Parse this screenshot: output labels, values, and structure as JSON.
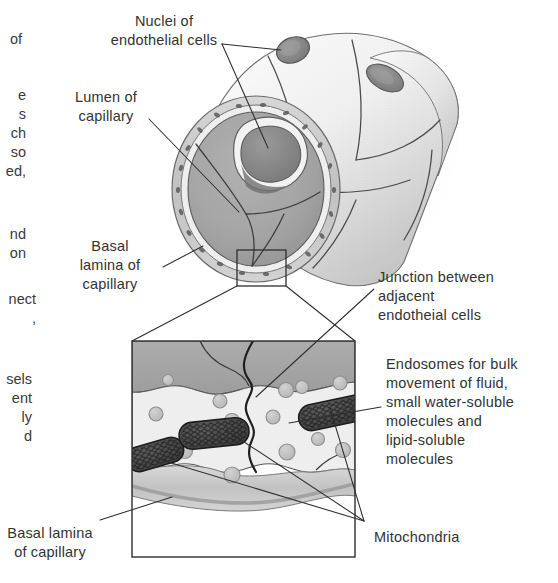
{
  "figure": {
    "colors": {
      "ink": "#333333",
      "leader_line": "#2e2e2e",
      "lumen_fill": "#a9a9a9",
      "lumen_fill_dark": "#8f8f8f",
      "tube_light": "#f4f4f4",
      "tube_mid": "#d9d9d9",
      "tube_shadow": "#b6b6b6",
      "nucleus": "#8a8a8a",
      "basal_lamina": "#c9c9c9",
      "endothelial_cytoplasm": "#ececec",
      "vesicle_fill": "#c4c4c4",
      "vesicle_stroke": "#8e8e8e",
      "mitochondrion": "#4a4a4a",
      "box_stroke": "#2e2e2e"
    }
  },
  "labels": {
    "nuclei": "Nuclei of\nendothelial cells",
    "lumen": "Lumen of\ncapillary",
    "basal_lamina_top": "Basal\nlamina of\ncapillary",
    "junction": "Junction between\nadjacent\nendotheial cells",
    "endosomes": "Endosomes for bulk\nmovement of fluid,\nsmall water-soluble\nmolecules and\nlipid-soluble\nmolecules",
    "basal_lamina_bottom": "Basal lamina\nof capillary",
    "mitochondria": "Mitochondria"
  },
  "column_fragments": {
    "frag_1": "of",
    "frag_2": "e\ns\nch\nso\ned,",
    "frag_3": "nd\non",
    "frag_4": "nect\n,",
    "frag_5": "sels\nent\nly\nd"
  }
}
